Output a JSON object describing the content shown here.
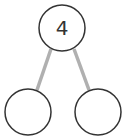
{
  "diagram": {
    "type": "number-bond",
    "whole": {
      "value": "4",
      "cx": 62,
      "cy": 28,
      "r": 23
    },
    "parts": [
      {
        "value": "",
        "cx": 28,
        "cy": 112,
        "r": 23
      },
      {
        "value": "",
        "cx": 98,
        "cy": 112,
        "r": 23
      }
    ],
    "colors": {
      "circle_stroke": "#333333",
      "connector": "#b0b0b0",
      "fill": "#ffffff"
    }
  }
}
